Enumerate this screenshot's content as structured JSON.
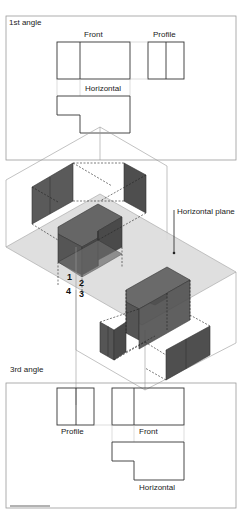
{
  "diagram": {
    "type": "orthographic-projection-explainer",
    "first_angle": {
      "title": "1st angle",
      "views": {
        "front": "Front",
        "profile": "Profile",
        "horizontal": "Horizontal"
      }
    },
    "third_angle": {
      "title": "3rd angle",
      "views": {
        "profile": "Profile",
        "front": "Front",
        "horizontal": "Horizontal"
      }
    },
    "isometric": {
      "plane_label": "Horizontal plane",
      "quadrants": [
        "1",
        "2",
        "3",
        "4"
      ]
    },
    "colors": {
      "line": "#333333",
      "frame": "#888888",
      "solid_face": "#5a5a5a",
      "solid_face_dark": "#4a4a4a",
      "plane": "#dcdcdc"
    }
  }
}
